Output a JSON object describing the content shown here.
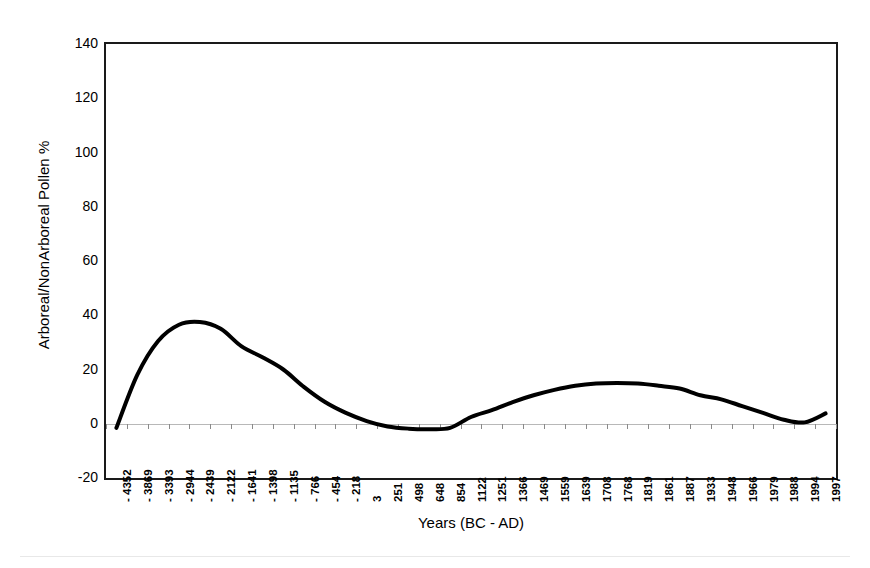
{
  "chart_data": {
    "type": "line",
    "title": "",
    "subtitle": "",
    "xlabel": "Years (BC - AD)",
    "ylabel": "Arboreal/NonArboreal Pollen %",
    "ylim": [
      -20,
      140
    ],
    "ytick_step": 20,
    "yticks": [
      140,
      120,
      100,
      80,
      60,
      40,
      20,
      0,
      -20
    ],
    "ytick_labels": [
      "140",
      "120",
      "100",
      "80",
      "60",
      "40",
      "20",
      "0",
      "-20"
    ],
    "grid": false,
    "zero_line": true,
    "legend": null,
    "legend_position": "none",
    "line_color": "#000000",
    "line_width": 4,
    "categories": [
      "- 4352",
      "- 3869",
      "- 3393",
      "- 2944",
      "- 2439",
      "- 2122",
      "- 1641",
      "- 1398",
      "- 1135",
      "- 766",
      "- 454",
      "- 218",
      "3",
      "251",
      "498",
      "648",
      "854",
      "1122",
      "1251",
      "1366",
      "1469",
      "1559",
      "1639",
      "1708",
      "1768",
      "1819",
      "1861",
      "1887",
      "1933",
      "1948",
      "1966",
      "1979",
      "1988",
      "1994",
      "1997"
    ],
    "x_numeric": [
      -4352,
      -3869,
      -3393,
      -2944,
      -2439,
      -2122,
      -1641,
      -1398,
      -1135,
      -766,
      -454,
      -218,
      3,
      251,
      498,
      648,
      854,
      1122,
      1251,
      1366,
      1469,
      1559,
      1639,
      1708,
      1768,
      1819,
      1861,
      1887,
      1933,
      1948,
      1966,
      1979,
      1988,
      1994,
      1997
    ],
    "values": [
      -1.5,
      18.0,
      30.5,
      36.5,
      37.5,
      35.0,
      28.5,
      24.5,
      20.0,
      13.5,
      8.0,
      4.0,
      1.0,
      -1.0,
      -1.8,
      -2.0,
      -1.5,
      2.5,
      5.0,
      8.0,
      10.5,
      12.5,
      14.0,
      14.8,
      15.0,
      14.8,
      14.0,
      13.0,
      10.5,
      9.0,
      6.5,
      4.0,
      1.5,
      0.5,
      3.8
    ],
    "annotations": [
      {
        "label": "first peak",
        "x": "- 2439",
        "y": 37.5
      },
      {
        "label": "trough",
        "x": "648",
        "y": -2.0
      },
      {
        "label": "second peak",
        "x": "1768",
        "y": 15.0
      }
    ]
  }
}
